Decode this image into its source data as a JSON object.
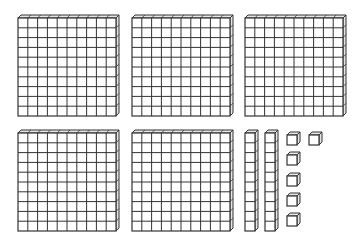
{
  "diagram": {
    "type": "base-ten-blocks",
    "stroke_color": "#333333",
    "face_color": "#ffffff",
    "side_color": "#e6e6e6",
    "flats": [
      {
        "x": 18,
        "y": 18,
        "size": 98
      },
      {
        "x": 132,
        "y": 18,
        "size": 98
      },
      {
        "x": 245,
        "y": 18,
        "size": 98
      },
      {
        "x": 18,
        "y": 133,
        "size": 98
      },
      {
        "x": 132,
        "y": 133,
        "size": 98
      }
    ],
    "rods": [
      {
        "x": 245,
        "y": 133,
        "w": 10,
        "h": 98
      },
      {
        "x": 265,
        "y": 133,
        "w": 10,
        "h": 98
      }
    ],
    "units": [
      {
        "x": 287,
        "y": 135,
        "size": 10
      },
      {
        "x": 309,
        "y": 135,
        "size": 10
      },
      {
        "x": 287,
        "y": 155,
        "size": 10
      },
      {
        "x": 287,
        "y": 176,
        "size": 10
      },
      {
        "x": 287,
        "y": 196,
        "size": 10
      },
      {
        "x": 287,
        "y": 216,
        "size": 10
      }
    ],
    "counts": {
      "hundreds": 5,
      "tens": 2,
      "ones": 6,
      "total": 526
    }
  }
}
